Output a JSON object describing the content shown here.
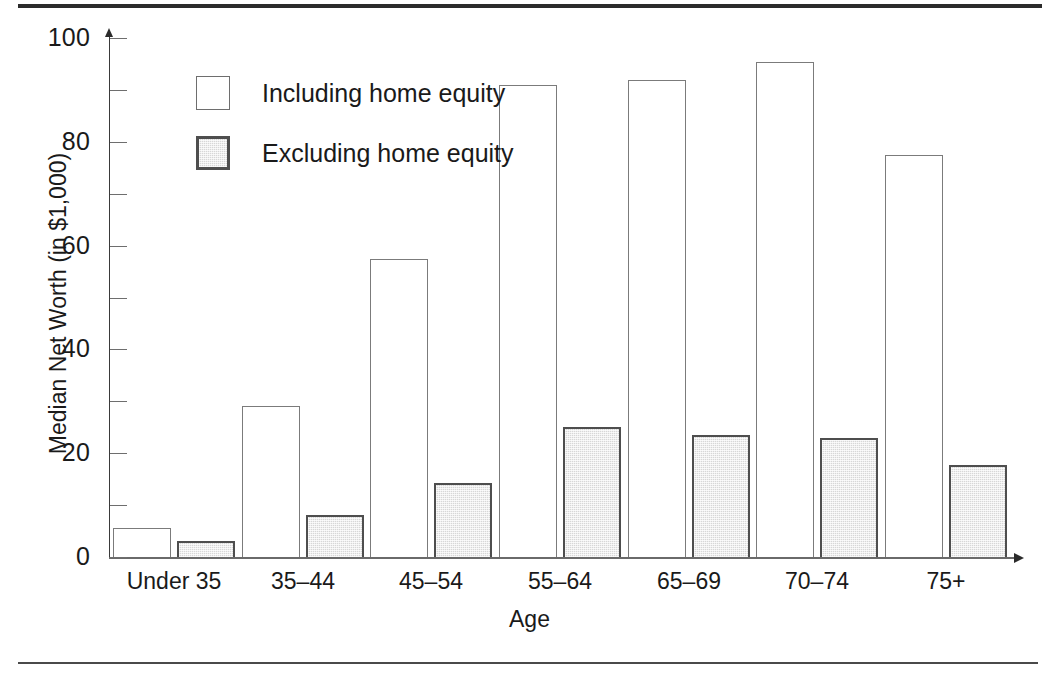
{
  "chart_data": {
    "type": "bar",
    "title": "",
    "xlabel": "Age",
    "ylabel": "Median Net Worth (in $1,000)",
    "categories": [
      "Under 35",
      "35–44",
      "45–54",
      "55–64",
      "65–69",
      "70–74",
      "75+"
    ],
    "series": [
      {
        "name": "Including home equity",
        "key": "including",
        "fill": "#ffffff",
        "border": "#7b7b7b",
        "values": [
          5.6,
          29.0,
          57.5,
          91.0,
          92.0,
          95.3,
          77.4
        ]
      },
      {
        "name": "Excluding home equity",
        "key": "excluding",
        "fill": "#d7d7d7",
        "border": "#4e4e4e",
        "values": [
          3.1,
          8.0,
          14.3,
          25.0,
          23.5,
          22.9,
          17.8
        ]
      }
    ],
    "ylim": [
      0,
      100
    ],
    "yticks_major": [
      0,
      20,
      40,
      60,
      80,
      100
    ],
    "yticks_minor": [
      10,
      30,
      50,
      70,
      90
    ],
    "ytick_labels": [
      "0",
      "20",
      "40",
      "60",
      "80",
      "100"
    ],
    "grid": false,
    "legend_position": "upper-left-inside"
  },
  "legend": {
    "items": [
      {
        "label": "Including home equity"
      },
      {
        "label": "Excluding home equity"
      }
    ]
  },
  "axes": {
    "x_title": "Age",
    "y_title": "Median Net Worth (in $1,000)"
  }
}
